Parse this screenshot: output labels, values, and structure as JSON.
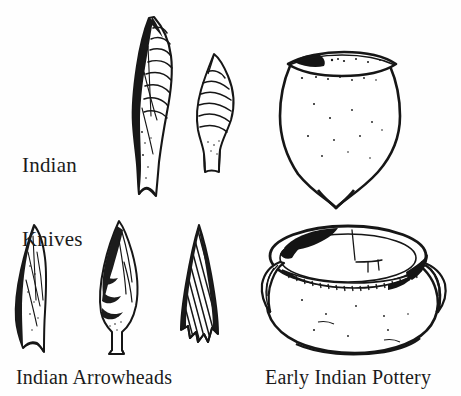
{
  "plate": {
    "title": "Indian Artifacts Plate",
    "background_color": "#fefefe",
    "ink_color": "#161616",
    "width": 461,
    "height": 396
  },
  "labels": {
    "knives": "Indian\nKnives",
    "knives_line1": "Indian",
    "knives_line2": "Knives",
    "arrowheads": "Indian Arrowheads",
    "pottery": "Early Indian Pottery"
  },
  "figures": {
    "knife_large": {
      "name": "large-chipped-stone-knife",
      "description": "Long narrow biface with dark shaded left edge and horizontal flake scars along right edge, squared base"
    },
    "knife_small": {
      "name": "small-chipped-stone-knife",
      "description": "Short leaf-shaped biface with horizontal flake scars and narrow stem"
    },
    "arrowhead_leaf": {
      "name": "leaf-shaped-arrowhead",
      "description": "Narrow lanceolate point with dark left margin and fine flake scars"
    },
    "arrowhead_stemmed": {
      "name": "stemmed-arrowhead",
      "description": "Leaf blade with curved dark flake bands and short square stem"
    },
    "arrowhead_notched": {
      "name": "corner-notched-triangular-arrowhead",
      "description": "Triangular point with diagonal hatching and basal corner notches"
    },
    "pot_conical": {
      "name": "conical-base-pot",
      "description": "Round-shouldered vessel with flaring rim, dark blotch at rim left, tapering to a pointed base"
    },
    "pot_bowl": {
      "name": "wide-mouth-bowl-with-lugs",
      "description": "Wide-mouthed globular bowl with lug handles at left and right, ladder-pattern decorative band beneath rim, shaded interior"
    }
  }
}
